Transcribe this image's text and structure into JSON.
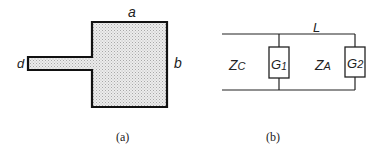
{
  "figure_a": {
    "caption": "(a)",
    "labels": {
      "width": "a",
      "height": "b",
      "feed_width": "d"
    }
  },
  "figure_b": {
    "caption": "(b)",
    "labels": {
      "length": "L",
      "zc_main": "Z",
      "zc_sub": "C",
      "g1_main": "G",
      "g1_sub": "1",
      "za_main": "Z",
      "za_sub": "A",
      "g2_main": "G",
      "g2_sub": "2"
    }
  },
  "colors": {
    "stroke": "#111111",
    "fill": "#e4e4e4",
    "text": "#222222"
  }
}
